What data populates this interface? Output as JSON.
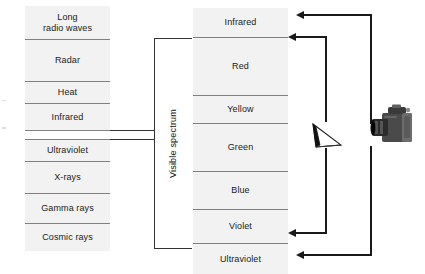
{
  "diagram": {
    "background_color": "#ffffff",
    "band_fill_color": "#f2f2f2",
    "line_color": "#333333",
    "text_color": "#1a1a1a"
  },
  "em_spectrum": {
    "name": "Electromagnetic spectrum",
    "bands": [
      {
        "label": "Long\nradio waves",
        "top": 0,
        "height": 33
      },
      {
        "label": "Radar",
        "top": 33,
        "height": 42
      },
      {
        "label": "Heat",
        "top": 75,
        "height": 22
      },
      {
        "label": "Infrared",
        "top": 97,
        "height": 27
      },
      {
        "label": "",
        "top": 124,
        "height": 9
      },
      {
        "label": "Ultraviolet",
        "top": 133,
        "height": 22
      },
      {
        "label": "X-rays",
        "top": 155,
        "height": 32
      },
      {
        "label": "Gamma rays",
        "top": 187,
        "height": 30
      },
      {
        "label": "Cosmic rays",
        "top": 217,
        "height": 28
      }
    ]
  },
  "visible_spectrum": {
    "bracket_label": "Visible spectrum",
    "bands": [
      {
        "label": "Infrared",
        "top": 0,
        "height": 29
      },
      {
        "label": "Red",
        "top": 29,
        "height": 58
      },
      {
        "label": "Yellow",
        "top": 87,
        "height": 28
      },
      {
        "label": "Green",
        "top": 115,
        "height": 48
      },
      {
        "label": "Blue",
        "top": 163,
        "height": 38
      },
      {
        "label": "Violet",
        "top": 201,
        "height": 34
      },
      {
        "label": "Ultraviolet",
        "top": 235,
        "height": 31
      }
    ]
  },
  "optics": {
    "prism_name": "prism",
    "camera_name": "camera",
    "ray_paths": [
      {
        "name": "upper-outer-ray",
        "direction": "left"
      },
      {
        "name": "upper-inner-ray",
        "direction": "left"
      },
      {
        "name": "lower-inner-ray",
        "direction": "left"
      },
      {
        "name": "lower-outer-ray",
        "direction": "left"
      }
    ]
  }
}
